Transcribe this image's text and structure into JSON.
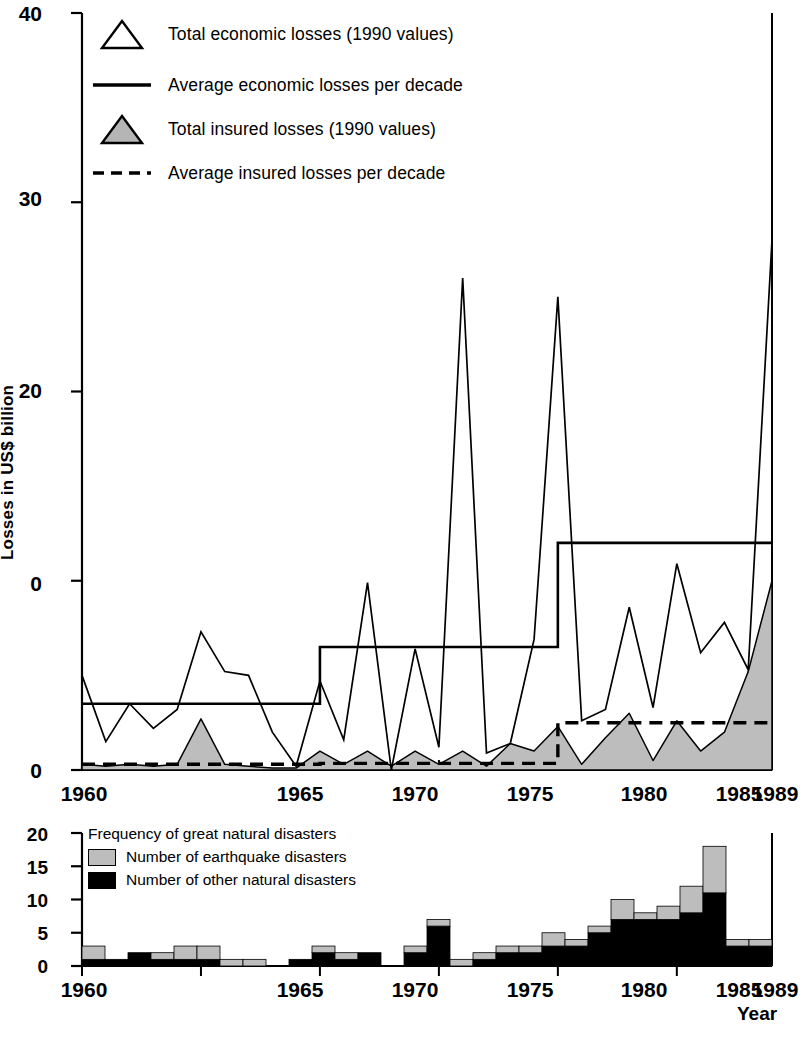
{
  "main_chart": {
    "y_axis_title": "Losses in US$ billion",
    "y_ticks": [
      "40",
      "30",
      "20",
      "0",
      "0"
    ],
    "x_ticks": [
      "1960",
      "1965",
      "1970",
      "1975",
      "1980",
      "1985",
      "1989"
    ],
    "legend": [
      {
        "key": "open-triangle",
        "label": "Total economic losses (1990 values)"
      },
      {
        "key": "solid-line",
        "label": "Average economic losses per decade"
      },
      {
        "key": "filled-triangle",
        "label": "Total insured losses (1990 values)"
      },
      {
        "key": "dashed-line",
        "label": "Average insured losses per decade"
      }
    ]
  },
  "bottom_chart": {
    "legend_title": "Frequency of great natural disasters",
    "legend": [
      {
        "key": "gray-swatch",
        "label": "Number of earthquake disasters"
      },
      {
        "key": "black-swatch",
        "label": "Number of other natural disasters"
      }
    ],
    "y_ticks": [
      "20",
      "15",
      "10",
      "5",
      "0"
    ],
    "x_ticks": [
      "1960",
      "1965",
      "1970",
      "1975",
      "1980",
      "1985",
      "1989"
    ],
    "x_axis_title": "Year"
  },
  "colors": {
    "line": "#000000",
    "fill_gray": "#bdbdbd",
    "fill_black": "#000000",
    "background": "#ffffff"
  },
  "chart_data": [
    {
      "type": "line",
      "title": "",
      "xlabel": "",
      "ylabel": "Losses in US$ billion",
      "xlim": [
        1960,
        1989
      ],
      "ylim": [
        0,
        40
      ],
      "ytick_values": [
        40,
        30,
        20,
        10,
        0
      ],
      "xtick_values": [
        1960,
        1965,
        1970,
        1975,
        1980,
        1985,
        1989
      ],
      "grid": false,
      "legend_position": "upper-left",
      "x": [
        1960,
        1961,
        1962,
        1963,
        1964,
        1965,
        1966,
        1967,
        1968,
        1969,
        1970,
        1971,
        1972,
        1973,
        1974,
        1975,
        1976,
        1977,
        1978,
        1979,
        1980,
        1981,
        1982,
        1983,
        1984,
        1985,
        1986,
        1987,
        1988,
        1989
      ],
      "series": [
        {
          "name": "Total economic losses (1990 values)",
          "style": "line-open-triangle",
          "values": [
            5.0,
            1.5,
            3.5,
            2.2,
            3.2,
            7.3,
            5.2,
            5.0,
            2.0,
            0.2,
            4.7,
            1.6,
            9.9,
            0.0,
            6.4,
            1.2,
            26.0,
            0.9,
            1.4,
            6.9,
            25.0,
            2.6,
            3.2,
            8.6,
            3.3,
            10.9,
            6.2,
            7.8,
            5.3,
            28.0
          ]
        },
        {
          "name": "Average economic losses per decade",
          "style": "step-solid",
          "decades": [
            {
              "range": [
                1960,
                1970
              ],
              "value": 3.5
            },
            {
              "range": [
                1970,
                1980
              ],
              "value": 6.5
            },
            {
              "range": [
                1980,
                1989
              ],
              "value": 12.0
            }
          ]
        },
        {
          "name": "Total insured losses (1990 values)",
          "style": "area-filled-gray",
          "values": [
            0.3,
            0.2,
            0.3,
            0.2,
            0.3,
            2.7,
            0.3,
            0.2,
            0.1,
            0.1,
            1.0,
            0.3,
            1.0,
            0.2,
            1.0,
            0.3,
            1.0,
            0.2,
            1.4,
            1.0,
            2.3,
            0.3,
            1.7,
            3.0,
            0.5,
            2.6,
            1.0,
            2.0,
            5.2,
            10.0
          ]
        },
        {
          "name": "Average insured losses per decade",
          "style": "step-dashed",
          "decades": [
            {
              "range": [
                1960,
                1970
              ],
              "value": 0.3
            },
            {
              "range": [
                1970,
                1980
              ],
              "value": 0.35
            },
            {
              "range": [
                1980,
                1989
              ],
              "value": 2.5
            }
          ]
        }
      ]
    },
    {
      "type": "bar",
      "title": "Frequency of great natural disasters",
      "xlabel": "Year",
      "ylabel": "",
      "xlim": [
        1960,
        1989
      ],
      "ylim": [
        0,
        20
      ],
      "ytick_values": [
        0,
        5,
        10,
        15,
        20
      ],
      "xtick_values": [
        1960,
        1965,
        1970,
        1975,
        1980,
        1985,
        1989
      ],
      "grid": false,
      "stacked": true,
      "categories": [
        1960,
        1961,
        1962,
        1963,
        1964,
        1965,
        1966,
        1967,
        1968,
        1969,
        1970,
        1971,
        1972,
        1973,
        1974,
        1975,
        1976,
        1977,
        1978,
        1979,
        1980,
        1981,
        1982,
        1983,
        1984,
        1985,
        1986,
        1987,
        1988,
        1989
      ],
      "series": [
        {
          "name": "Number of other natural disasters",
          "color": "#000000",
          "values": [
            1,
            1,
            2,
            1,
            1,
            1,
            0,
            0,
            0,
            1,
            2,
            1,
            2,
            0,
            2,
            6,
            0,
            1,
            2,
            2,
            3,
            3,
            5,
            7,
            7,
            7,
            8,
            11,
            3,
            3
          ]
        },
        {
          "name": "Number of earthquake disasters",
          "color": "#bdbdbd",
          "values": [
            2,
            0,
            0,
            1,
            2,
            2,
            1,
            1,
            0,
            0,
            1,
            1,
            0,
            0,
            1,
            1,
            1,
            1,
            1,
            1,
            2,
            1,
            1,
            3,
            1,
            2,
            4,
            7,
            1,
            1
          ]
        }
      ]
    }
  ]
}
